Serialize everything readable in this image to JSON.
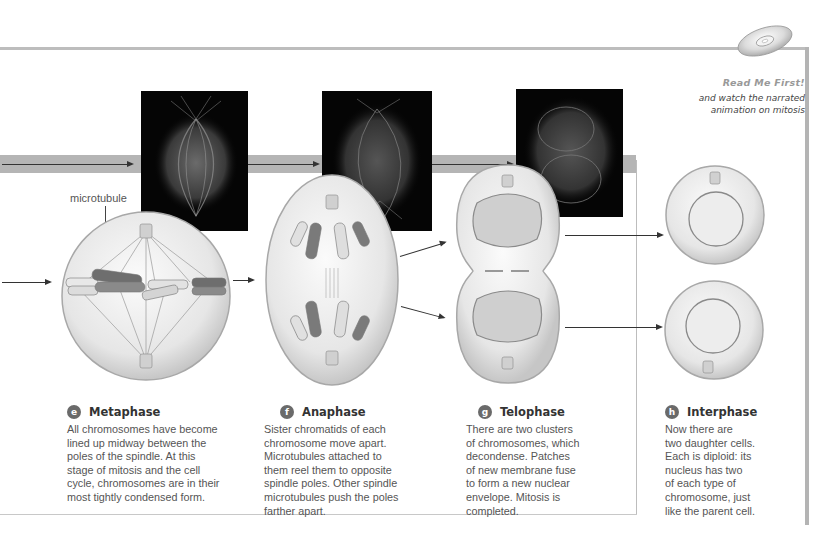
{
  "cd_promo": {
    "icon": "cd-disc-icon",
    "title": "Read Me First!",
    "subtitle_line1": "and watch the narrated",
    "subtitle_line2": "animation on mitosis"
  },
  "labels": {
    "microtubule": "microtubule"
  },
  "stages": [
    {
      "letter": "e",
      "title": "Metaphase",
      "lines": [
        "All chromosomes have become",
        "lined up midway between the",
        "poles of the spindle. At this",
        "stage of mitosis and the cell",
        "cycle, chromosomes are in their",
        "most tightly condensed form."
      ]
    },
    {
      "letter": "f",
      "title": "Anaphase",
      "lines": [
        "Sister chromatids of each",
        "chromosome move apart.",
        "Microtubules attached to",
        "them reel them to opposite",
        "spindle poles. Other spindle",
        "microtubules push the poles",
        "farther apart."
      ]
    },
    {
      "letter": "g",
      "title": "Telophase",
      "lines": [
        "There are two clusters",
        "of chromosomes, which",
        "decondense. Patches",
        "of new membrane fuse",
        "to form a new nuclear",
        "envelope. Mitosis is",
        "completed."
      ]
    },
    {
      "letter": "h",
      "title": "Interphase",
      "lines": [
        "Now there are",
        "two daughter cells.",
        "Each is diploid: its",
        "nucleus has two",
        "of each type of",
        "chromosome, just",
        "like the parent cell."
      ]
    }
  ],
  "colors": {
    "band": "#b5b5b5",
    "badge": "#6a6a6a",
    "chromosome_dark": "#7a7a7a",
    "chromosome_light": "#d8d8d8"
  }
}
